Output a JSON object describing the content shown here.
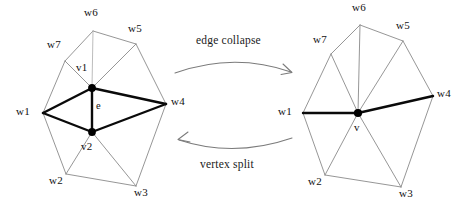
{
  "figure": {
    "background_color": "#ffffff",
    "bold_edge_color": "#0a0a0a",
    "mesh_edge_color": "#8a8a8a",
    "arrow_color": "#7b7b7b",
    "vertex_color": "#000000"
  },
  "operations": {
    "forward": {
      "label": "edge collapse",
      "direction": "left-to-right"
    },
    "reverse": {
      "label": "vertex split",
      "direction": "right-to-left"
    }
  },
  "left_mesh": {
    "name": "before-collapse",
    "edge_label": "e",
    "vertices": [
      {
        "id": "v1",
        "label": "v1",
        "x": 92,
        "y": 88,
        "kind": "collapsed-endpoint"
      },
      {
        "id": "v2",
        "label": "v2",
        "x": 92,
        "y": 132,
        "kind": "collapsed-endpoint"
      },
      {
        "id": "w1",
        "label": "w1",
        "x": 43,
        "y": 113,
        "kind": "ring"
      },
      {
        "id": "w2",
        "label": "w2",
        "x": 66,
        "y": 174,
        "kind": "ring"
      },
      {
        "id": "w3",
        "label": "w3",
        "x": 136,
        "y": 186,
        "kind": "ring"
      },
      {
        "id": "w4",
        "label": "w4",
        "x": 166,
        "y": 104,
        "kind": "ring"
      },
      {
        "id": "w5",
        "label": "w5",
        "x": 136,
        "y": 44,
        "kind": "ring"
      },
      {
        "id": "w6",
        "label": "w6",
        "x": 93,
        "y": 31,
        "kind": "ring"
      },
      {
        "id": "w7",
        "label": "w7",
        "x": 65,
        "y": 61,
        "kind": "ring"
      }
    ],
    "bold_edges": [
      [
        "v1",
        "v2"
      ],
      [
        "w1",
        "v1"
      ],
      [
        "w1",
        "v2"
      ],
      [
        "v1",
        "w4"
      ],
      [
        "v2",
        "w4"
      ]
    ],
    "mesh_edges": [
      [
        "w1",
        "w7"
      ],
      [
        "w7",
        "w6"
      ],
      [
        "w6",
        "w5"
      ],
      [
        "w5",
        "w4"
      ],
      [
        "w4",
        "w3"
      ],
      [
        "w3",
        "w2"
      ],
      [
        "w2",
        "w1"
      ],
      [
        "v1",
        "w7"
      ],
      [
        "v1",
        "w6"
      ],
      [
        "v1",
        "w5"
      ],
      [
        "v2",
        "w2"
      ],
      [
        "v2",
        "w3"
      ]
    ]
  },
  "right_mesh": {
    "name": "after-collapse",
    "vertices": [
      {
        "id": "v",
        "label": "v",
        "x": 358,
        "y": 113,
        "kind": "merged-vertex"
      },
      {
        "id": "w1",
        "label": "w1",
        "x": 303,
        "y": 113,
        "kind": "ring"
      },
      {
        "id": "w2",
        "label": "w2",
        "x": 325,
        "y": 175,
        "kind": "ring"
      },
      {
        "id": "w3",
        "label": "w3",
        "x": 401,
        "y": 187,
        "kind": "ring"
      },
      {
        "id": "w4",
        "label": "w4",
        "x": 433,
        "y": 96,
        "kind": "ring"
      },
      {
        "id": "w5",
        "label": "w5",
        "x": 403,
        "y": 41,
        "kind": "ring"
      },
      {
        "id": "w6",
        "label": "w6",
        "x": 360,
        "y": 25,
        "kind": "ring"
      },
      {
        "id": "w7",
        "label": "w7",
        "x": 331,
        "y": 54,
        "kind": "ring"
      }
    ],
    "bold_edges": [
      [
        "w1",
        "v"
      ],
      [
        "v",
        "w4"
      ]
    ],
    "mesh_edges": [
      [
        "w1",
        "w7"
      ],
      [
        "w7",
        "w6"
      ],
      [
        "w6",
        "w5"
      ],
      [
        "w5",
        "w4"
      ],
      [
        "w4",
        "w3"
      ],
      [
        "w3",
        "w2"
      ],
      [
        "w2",
        "w1"
      ],
      [
        "v",
        "w7"
      ],
      [
        "v",
        "w6"
      ],
      [
        "v",
        "w5"
      ],
      [
        "v",
        "w2"
      ],
      [
        "v",
        "w3"
      ]
    ]
  },
  "labels": {
    "left": {
      "v1": "v1",
      "v2": "v2",
      "e": "e",
      "w1": "w1",
      "w2": "w2",
      "w3": "w3",
      "w4": "w4",
      "w5": "w5",
      "w6": "w6",
      "w7": "w7"
    },
    "right": {
      "v": "v",
      "w1": "w1",
      "w2": "w2",
      "w3": "w3",
      "w4": "w4",
      "w5": "w5",
      "w6": "w6",
      "w7": "w7"
    }
  }
}
